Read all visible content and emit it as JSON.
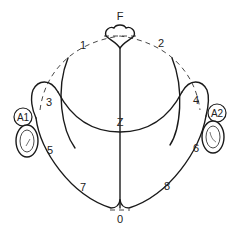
{
  "diagram": {
    "type": "EEG electrode placement (head viewed from above)",
    "labels": {
      "front": "F",
      "center": "Z",
      "back": "0",
      "e1": "1",
      "e2": "2",
      "e3": "3",
      "e4": "4",
      "e5": "5",
      "e6": "6",
      "e7": "7",
      "e8": "8",
      "left_ear": "A1",
      "right_ear": "A2"
    },
    "colors": {
      "line": "#1a1a1a",
      "background": "#ffffff"
    }
  }
}
